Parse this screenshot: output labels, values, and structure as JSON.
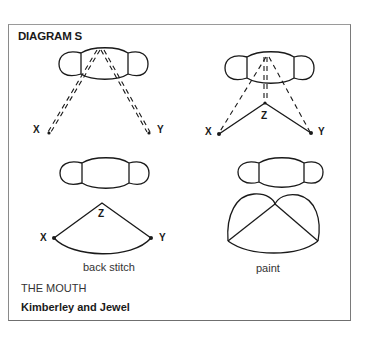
{
  "diagram": {
    "title": "DIAGRAM S",
    "panels": [
      {
        "id": "top-left",
        "description": "mouth with double dashed stitches converging to top center",
        "points": [
          "X",
          "Y"
        ]
      },
      {
        "id": "top-right",
        "description": "mouth with dashed lines to X, Y and double dashed to Z; solid lines X-Z-Y",
        "points": [
          "X",
          "Z",
          "Y"
        ]
      },
      {
        "id": "bottom-left",
        "description": "mouth with arc stitch X-Z-Y",
        "points": [
          "X",
          "Z",
          "Y"
        ],
        "caption": "back stitch"
      },
      {
        "id": "bottom-right",
        "description": "mouth with painted area",
        "caption": "paint"
      }
    ],
    "labels": {
      "x": "X",
      "y": "Y",
      "z": "Z"
    },
    "footer": {
      "subtitle": "THE MOUTH",
      "credit": "Kimberley and Jewel"
    }
  },
  "colors": {
    "ink": "#1a1a1a",
    "frame": "#7a7a7a",
    "background": "#ffffff"
  }
}
